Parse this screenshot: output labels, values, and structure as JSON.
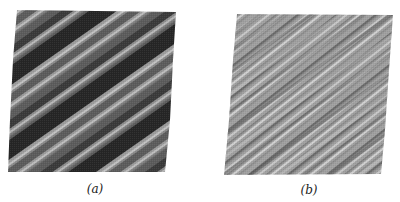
{
  "figure": {
    "panels": [
      {
        "id": "a",
        "label": "(a)",
        "description": "Diagonal stripe pattern with high-contrast dark and mid-gray bands separated by thin light lines",
        "colors": {
          "dark": "#262626",
          "mid": "#5c5c5c",
          "light": "#b8b8b8"
        }
      },
      {
        "id": "b",
        "label": "(b)",
        "description": "Finer, lower-contrast diagonal stripe pattern on light gray background",
        "colors": {
          "base": "#9c9c9c",
          "dark": "#5a5a5a",
          "light": "#cfcfcf"
        }
      }
    ]
  }
}
